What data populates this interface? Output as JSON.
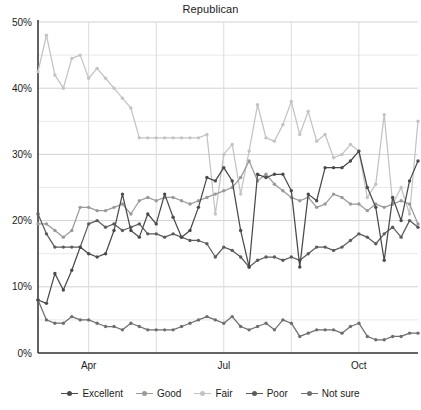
{
  "chart_data": {
    "type": "line",
    "title": "Republican",
    "xlabel": "",
    "ylabel": "",
    "ylim": [
      0,
      50
    ],
    "ytick_labels": [
      "0%",
      "10%",
      "20%",
      "30%",
      "40%",
      "50%"
    ],
    "ytick_values": [
      0,
      10,
      20,
      30,
      40,
      50
    ],
    "y_minor_step": 5,
    "grid": true,
    "legend_position": "bottom",
    "xtick_labels": [
      "Apr",
      "Jul",
      "Oct"
    ],
    "xtick_index": [
      6,
      22,
      38
    ],
    "x_gridline_index": [
      6,
      14,
      22,
      30,
      38
    ],
    "n_points": 46,
    "series": [
      {
        "name": "Excellent",
        "color": "#4a4a4a",
        "values": [
          8,
          7.5,
          12,
          9.5,
          12.5,
          16,
          15,
          14.5,
          15,
          18.5,
          24,
          18.5,
          17.5,
          21,
          19.5,
          24,
          20.5,
          17.5,
          18.5,
          22,
          26.5,
          26,
          28,
          26,
          18.5,
          13,
          27,
          26.5,
          27,
          27,
          24.5,
          13,
          24,
          23,
          28,
          28,
          28,
          29,
          30.5,
          25,
          22,
          14,
          23.5,
          20,
          26,
          29
        ]
      },
      {
        "name": "Good",
        "color": "#9a9a9a",
        "values": [
          19.5,
          19.5,
          18.5,
          17.5,
          18.5,
          22,
          22,
          21.5,
          21.5,
          22,
          22.5,
          21,
          23,
          23.5,
          23,
          23.5,
          23.5,
          23,
          22.5,
          23,
          23.5,
          24,
          24.5,
          25,
          26.5,
          29,
          26,
          27,
          25.5,
          24.5,
          23.5,
          23,
          23.5,
          22,
          22.5,
          24,
          23.5,
          22.5,
          22.5,
          21.5,
          22.5,
          22,
          22.5,
          23,
          22.5,
          19.5
        ]
      },
      {
        "name": "Fair",
        "color": "#c3c3c3",
        "values": [
          42.5,
          48,
          42,
          40,
          44.5,
          45,
          41.5,
          43,
          41.5,
          40,
          38.5,
          37,
          32.5,
          32.5,
          32.5,
          32.5,
          32.5,
          32.5,
          32.5,
          32.5,
          33,
          21,
          30,
          31.5,
          24,
          30.5,
          37.5,
          32.5,
          32,
          34.5,
          38,
          33,
          36.5,
          32,
          33,
          29.5,
          30,
          31.5,
          30.5,
          23.5,
          25.5,
          36,
          22.5,
          25,
          21,
          35
        ]
      },
      {
        "name": "Poor",
        "color": "#5c5c5c",
        "values": [
          21,
          18,
          16,
          16,
          16,
          16,
          19.5,
          20,
          19,
          19.5,
          18.5,
          19,
          19.5,
          18,
          18,
          17.5,
          18,
          17.5,
          17,
          17,
          16.5,
          14.5,
          16,
          15.5,
          14.5,
          13,
          14,
          14.5,
          14.5,
          14,
          14.5,
          14,
          15,
          16,
          16,
          15.5,
          16,
          17,
          18,
          17.5,
          16.5,
          18,
          19,
          17.5,
          20,
          19
        ]
      },
      {
        "name": "Not sure",
        "color": "#6f6f6f",
        "values": [
          8,
          5,
          4.5,
          4.5,
          5.5,
          5,
          5,
          4.5,
          4,
          4,
          3.5,
          4.5,
          4,
          3.5,
          3.5,
          3.5,
          3.5,
          4,
          4.5,
          5,
          5.5,
          5,
          4.5,
          5.5,
          4,
          3.5,
          4,
          4.5,
          3.5,
          5,
          4.5,
          2.5,
          3,
          3.5,
          3.5,
          3.5,
          3,
          4,
          4.5,
          2.5,
          2,
          2,
          2.5,
          2.5,
          3,
          3
        ]
      }
    ]
  }
}
